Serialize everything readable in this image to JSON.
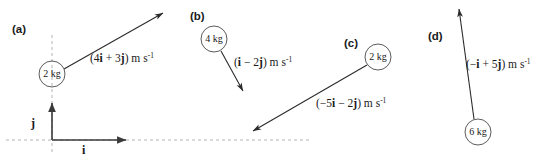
{
  "figure": {
    "background_color": "#ffffff",
    "stroke_color": "#2b2b2b",
    "dashed_axis_color": "#b4b4b4"
  },
  "axes": {
    "i_label": "i",
    "j_label": "j",
    "origin": [
      52,
      140
    ],
    "i_arrow_end": [
      128,
      140
    ],
    "j_arrow_end": [
      52,
      101
    ]
  },
  "panels": [
    {
      "letter": "(a)",
      "mass": "2 kg",
      "circle": {
        "cx": 52,
        "cy": 74,
        "r": 13
      },
      "vector": {
        "x": 4,
        "y": 3
      },
      "velocity_label": "(4i + 3j) m s",
      "velocity_exponent": "-1",
      "velocity_parts": {
        "open": "(",
        "i_coeff": "4",
        "i": "i",
        "op": " + ",
        "j_coeff": "3",
        "j": "j",
        "close": ") m s"
      },
      "arrow_start": [
        64,
        69
      ],
      "arrow_end": [
        164,
        13
      ],
      "label_pos": [
        90,
        62
      ]
    },
    {
      "letter": "(b)",
      "mass": "4 kg",
      "circle": {
        "cx": 214,
        "cy": 39,
        "r": 13
      },
      "vector": {
        "x": 1,
        "y": -2
      },
      "velocity_label": "(i - 2j) m s",
      "velocity_exponent": "-1",
      "velocity_parts": {
        "open": "(",
        "i_coeff": "",
        "i": "i",
        "op": " − ",
        "j_coeff": "2",
        "j": "j",
        "close": ") m s"
      },
      "arrow_start": [
        221,
        51
      ],
      "arrow_end": [
        244,
        92
      ],
      "label_pos": [
        234,
        66
      ]
    },
    {
      "letter": "(c)",
      "mass": "2 kg",
      "circle": {
        "cx": 378,
        "cy": 57,
        "r": 13
      },
      "vector": {
        "x": -5,
        "y": -2
      },
      "velocity_label": "(-5i - 2j) m s",
      "velocity_exponent": "-1",
      "velocity_parts": {
        "open": "(−",
        "i_coeff": "5",
        "i": "i",
        "op": " − ",
        "j_coeff": "2",
        "j": "j",
        "close": ") m s"
      },
      "arrow_start": [
        367,
        65
      ],
      "arrow_end": [
        252,
        132
      ],
      "label_pos": [
        316,
        107
      ]
    },
    {
      "letter": "(d)",
      "mass": "6 kg",
      "circle": {
        "cx": 478,
        "cy": 132,
        "r": 13
      },
      "vector": {
        "x": -1,
        "y": 5
      },
      "velocity_label": "(-i + 5j) m s",
      "velocity_exponent": "-1",
      "velocity_parts": {
        "open": "(−",
        "i_coeff": "",
        "i": "i",
        "op": " + ",
        "j_coeff": "5",
        "j": "j",
        "close": ") m s"
      },
      "arrow_start": [
        474,
        119
      ],
      "arrow_end": [
        458,
        8
      ],
      "label_pos": [
        466,
        68
      ]
    }
  ],
  "letter_positions": {
    "a": [
      12,
      33
    ],
    "b": [
      190,
      20
    ],
    "c": [
      344,
      47
    ],
    "d": [
      428,
      40
    ]
  }
}
